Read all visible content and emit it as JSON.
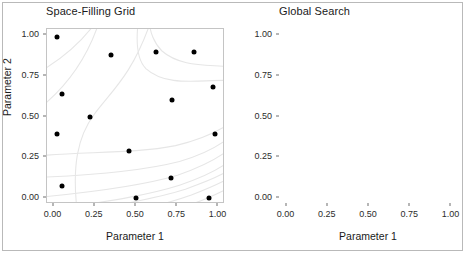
{
  "figure": {
    "y_axis_title": "Parameter 2",
    "background": "#ffffff",
    "border_color": "#b9b9b9",
    "point_color": "#000000",
    "contour_color": "#e4e4e4"
  },
  "panels": [
    {
      "title": "Space-Filling Grid",
      "x_axis_title": "Parameter 1"
    },
    {
      "title": "Global Search",
      "x_axis_title": "Parameter 1"
    }
  ],
  "axis": {
    "x_ticks": [
      "0.00",
      "0.25",
      "0.50",
      "0.75",
      "1.00"
    ],
    "x_tick_values": [
      0.0,
      0.25,
      0.5,
      0.75,
      1.0
    ],
    "y_ticks": [
      "0.00",
      "0.25",
      "0.50",
      "0.75",
      "1.00"
    ],
    "y_tick_values": [
      0.0,
      0.25,
      0.5,
      0.75,
      1.0
    ]
  },
  "chart_data": [
    {
      "type": "scatter",
      "title": "Space-Filling Grid",
      "xlabel": "Parameter 1",
      "ylabel": "Parameter 2",
      "xlim": [
        -0.04,
        1.04
      ],
      "ylim": [
        -0.04,
        1.04
      ],
      "grid": false,
      "legend": "none",
      "background_surface": "contour lines (light grey) of a response surface, curving from upper-left around a central ridge toward the lower-right",
      "series": [
        {
          "name": "Grid design points",
          "marker": "filled circle",
          "color": "#000000",
          "x": [
            0.02,
            0.35,
            0.62,
            0.85,
            0.05,
            0.72,
            0.97,
            0.22,
            0.02,
            0.98,
            0.46,
            0.05,
            0.5,
            0.71,
            0.94
          ],
          "y": [
            0.99,
            0.88,
            0.9,
            0.9,
            0.64,
            0.6,
            0.68,
            0.5,
            0.39,
            0.39,
            0.29,
            0.07,
            0.0,
            0.12,
            0.0
          ]
        }
      ]
    },
    {
      "type": "scatter",
      "title": "Global Search",
      "xlabel": "Parameter 1",
      "ylabel": "Parameter 2",
      "xlim": [
        -0.04,
        1.04
      ],
      "ylim": [
        -0.04,
        1.04
      ],
      "grid": false,
      "legend": "none",
      "background_surface": "contour lines (light grey) of a response surface, identical to the left panel",
      "series": [
        {
          "name": "Search iterates",
          "marker": "filled circle",
          "color": "#000000",
          "x": [
            0.915,
            0.925,
            0.935,
            0.945,
            0.952,
            0.958,
            0.94,
            0.93,
            0.922,
            0.948,
            0.962,
            0.9,
            0.875,
            0.84,
            0.97,
            0.76,
            0.735,
            0.7,
            0.64,
            0.48,
            0.385,
            0.31,
            0.255,
            0.215,
            0.15,
            0.12,
            0.105,
            0.095,
            0.082,
            0.075,
            0.068,
            0.06,
            0.055,
            0.072,
            0.088,
            0.1,
            0.062,
            0.048,
            0.04,
            0.03,
            0.048,
            0.062,
            0.075,
            0.028,
            0.172,
            0.13,
            0.095,
            0.072,
            0.058,
            0.045,
            0.038,
            0.032,
            0.028,
            0.025,
            0.023,
            0.026,
            0.03,
            0.035,
            0.042,
            0.05,
            0.058,
            0.066,
            0.074,
            0.082,
            0.09,
            0.098,
            0.105,
            0.112,
            0.118,
            0.122,
            0.126
          ],
          "y": [
            0.995,
            0.995,
            0.992,
            0.99,
            0.985,
            0.975,
            0.968,
            0.972,
            0.96,
            0.958,
            0.945,
            0.952,
            0.94,
            0.925,
            0.935,
            0.905,
            0.88,
            0.855,
            0.78,
            0.735,
            0.74,
            0.68,
            0.64,
            0.625,
            0.61,
            0.598,
            0.62,
            0.64,
            0.665,
            0.69,
            0.71,
            0.735,
            0.762,
            0.7,
            0.672,
            0.655,
            0.645,
            0.668,
            0.7,
            0.548,
            0.565,
            0.538,
            0.52,
            0.46,
            0.52,
            0.47,
            0.445,
            0.408,
            0.375,
            0.342,
            0.312,
            0.285,
            0.262,
            0.24,
            0.222,
            0.208,
            0.196,
            0.186,
            0.178,
            0.17,
            0.162,
            0.155,
            0.148,
            0.14,
            0.133,
            0.126,
            0.118,
            0.11,
            0.102,
            0.096,
            0.092
          ]
        }
      ]
    }
  ]
}
